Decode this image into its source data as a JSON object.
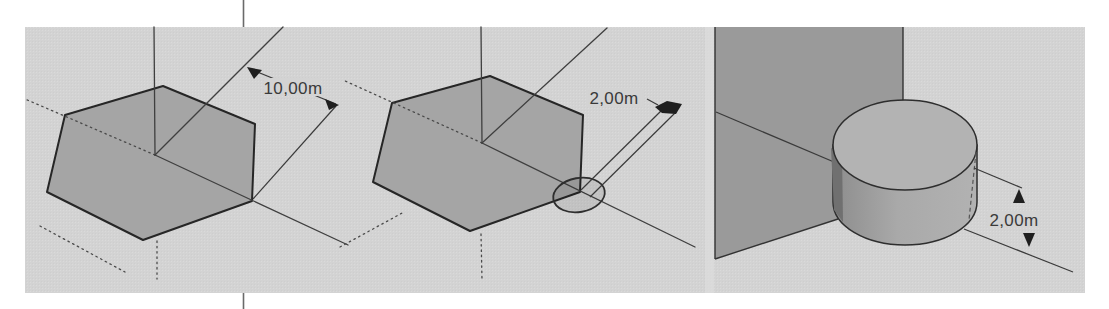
{
  "figure": {
    "panels": [
      {
        "id": "hexagon-radius",
        "dimension_label": "10,00m"
      },
      {
        "id": "hexagon-corner-circle",
        "dimension_label": "2,00m"
      },
      {
        "id": "cylinder-height",
        "dimension_label": "2,00m"
      }
    ]
  },
  "colors": {
    "page": "#ffffff",
    "viewport_bg": "#d3d3d3",
    "face_fill": "#a5a5a5",
    "wall_fill": "#9a9a9a",
    "cylinder_top": "#b3b3b3",
    "cylinder_body_light": "#aeaeae",
    "cylinder_body_dark": "#8d8d8d",
    "cylinder_shadow": "#707070",
    "circle_tint": "rgba(0,0,0,0.08)",
    "rule": "#6a6a6a"
  }
}
